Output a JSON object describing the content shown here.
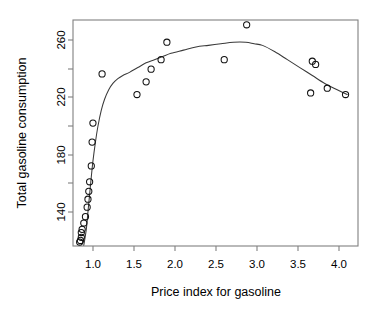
{
  "chart_data": {
    "type": "scatter",
    "title": "",
    "subtitle": "",
    "xlabel": "Price index for gasoline",
    "ylabel": "Total gasoline consumption",
    "xlim": [
      0.82,
      4.25
    ],
    "ylim": [
      130.5,
      273.0
    ],
    "xticks": [
      1.0,
      1.5,
      2.0,
      2.5,
      3.0,
      3.5,
      4.0
    ],
    "xticklabels": [
      "1.0",
      "1.5",
      "2.0",
      "2.5",
      "3.0",
      "3.5",
      "4.0"
    ],
    "yticks": [
      140,
      180,
      220,
      260
    ],
    "yticklabels": [
      "140",
      "180",
      "220",
      "260"
    ],
    "yminorticks": [
      160,
      200,
      240
    ],
    "grid": false,
    "legend": null,
    "legend_position": "none",
    "marker": "open-circle",
    "point_color": "#111111",
    "curve_color": "#3a3a3a",
    "frame_color": "#808080",
    "background": "#ffffff",
    "n_points": 27,
    "x": [
      0.9,
      0.91,
      0.92,
      0.92,
      0.93,
      0.95,
      0.97,
      0.99,
      1.0,
      1.01,
      1.02,
      1.04,
      1.05,
      1.06,
      1.17,
      1.59,
      1.7,
      1.76,
      1.88,
      1.95,
      2.64,
      2.91,
      3.68,
      3.7,
      3.74,
      3.88,
      4.1
    ],
    "y": [
      133,
      134,
      136,
      139,
      141,
      145,
      149,
      155,
      160,
      165,
      171,
      181,
      196,
      208,
      239,
      226,
      234,
      242,
      248,
      259,
      248,
      270,
      227,
      247,
      245,
      230,
      226
    ],
    "points": [
      {
        "x": 0.9,
        "y": 133
      },
      {
        "x": 0.91,
        "y": 134
      },
      {
        "x": 0.92,
        "y": 136
      },
      {
        "x": 0.92,
        "y": 139
      },
      {
        "x": 0.93,
        "y": 141
      },
      {
        "x": 0.95,
        "y": 145
      },
      {
        "x": 0.97,
        "y": 149
      },
      {
        "x": 0.99,
        "y": 155
      },
      {
        "x": 1.0,
        "y": 160
      },
      {
        "x": 1.01,
        "y": 165
      },
      {
        "x": 1.02,
        "y": 171
      },
      {
        "x": 1.04,
        "y": 181
      },
      {
        "x": 1.05,
        "y": 196
      },
      {
        "x": 1.06,
        "y": 208
      },
      {
        "x": 1.17,
        "y": 239
      },
      {
        "x": 1.59,
        "y": 226
      },
      {
        "x": 1.7,
        "y": 234
      },
      {
        "x": 1.76,
        "y": 242
      },
      {
        "x": 1.88,
        "y": 248
      },
      {
        "x": 1.95,
        "y": 259
      },
      {
        "x": 2.64,
        "y": 248
      },
      {
        "x": 2.91,
        "y": 270
      },
      {
        "x": 3.68,
        "y": 227
      },
      {
        "x": 3.7,
        "y": 247
      },
      {
        "x": 3.74,
        "y": 245
      },
      {
        "x": 3.88,
        "y": 230
      },
      {
        "x": 4.1,
        "y": 226
      }
    ],
    "series": [
      {
        "name": "observations",
        "type": "scatter",
        "marker": "open-circle",
        "values": [
          133,
          134,
          136,
          139,
          141,
          145,
          149,
          155,
          160,
          165,
          171,
          181,
          196,
          208,
          239,
          226,
          234,
          242,
          248,
          259,
          248,
          270,
          227,
          247,
          245,
          230,
          226
        ]
      },
      {
        "name": "fitted-smooth-curve",
        "type": "line",
        "x": [
          0.95,
          0.98,
          1.0,
          1.02,
          1.04,
          1.06,
          1.09,
          1.12,
          1.16,
          1.2,
          1.25,
          1.3,
          1.36,
          1.42,
          1.5,
          1.6,
          1.7,
          1.8,
          1.9,
          2.0,
          2.15,
          2.3,
          2.45,
          2.6,
          2.75,
          2.9,
          3.0,
          3.1,
          3.25,
          3.4,
          3.55,
          3.7,
          3.85,
          4.0,
          4.12
        ],
        "y": [
          131,
          141,
          152,
          163,
          174,
          184,
          196,
          206,
          216,
          223,
          229,
          233,
          236,
          238,
          240,
          243,
          246,
          248,
          250,
          252,
          254,
          256,
          257,
          258,
          259,
          259,
          258,
          257,
          253,
          248,
          243,
          238,
          233,
          229,
          226
        ]
      }
    ]
  }
}
